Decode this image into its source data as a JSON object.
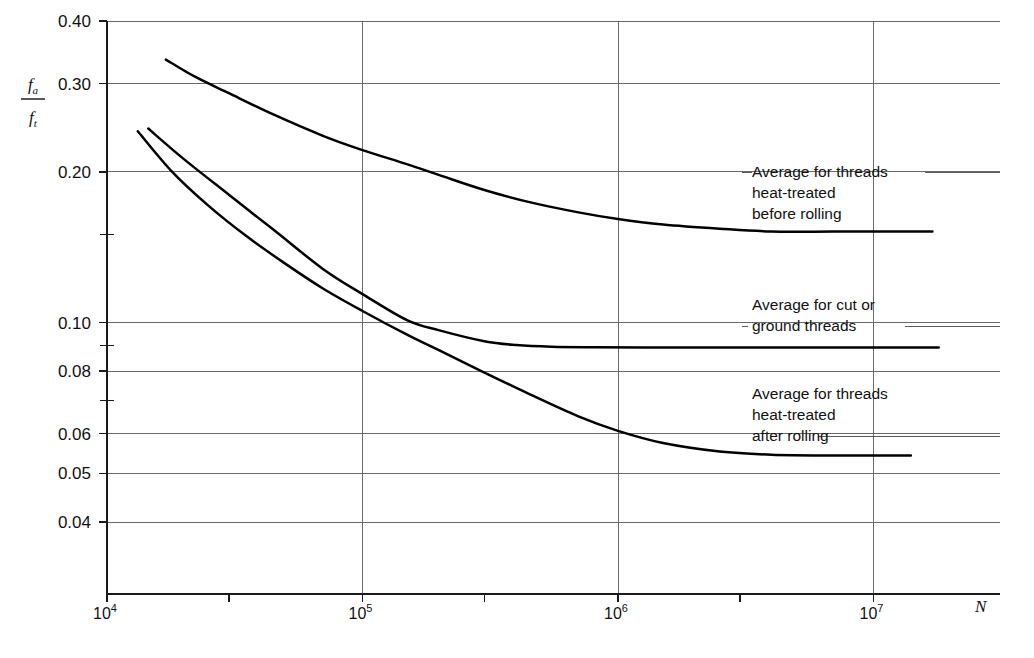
{
  "chart_data": {
    "type": "line",
    "title": "",
    "xlabel": "N",
    "ylabel": "fa/ft",
    "ylabel_numerator": "f",
    "ylabel_numerator_sub": "a",
    "ylabel_denominator": "f",
    "ylabel_denominator_sub": "t",
    "x_scale": "log",
    "y_scale": "log",
    "xlim": [
      10000,
      20000000
    ],
    "ylim": [
      0.032,
      0.44
    ],
    "grid": true,
    "legend_position": "inline-annotations",
    "x_ticks": [
      {
        "value": 10000,
        "label": "10",
        "exponent": "4",
        "major": true
      },
      {
        "value": 30000,
        "label": "",
        "exponent": "",
        "major": false
      },
      {
        "value": 100000,
        "label": "10",
        "exponent": "5",
        "major": true
      },
      {
        "value": 300000,
        "label": "",
        "exponent": "",
        "major": false
      },
      {
        "value": 1000000,
        "label": "10",
        "exponent": "6",
        "major": true
      },
      {
        "value": 3000000,
        "label": "",
        "exponent": "",
        "major": false
      },
      {
        "value": 10000000,
        "label": "10",
        "exponent": "7",
        "major": true
      }
    ],
    "y_ticks": [
      {
        "value": 0.4,
        "label": "0.40",
        "major": true
      },
      {
        "value": 0.3,
        "label": "0.30",
        "major": true
      },
      {
        "value": 0.2,
        "label": "0.20",
        "major": true
      },
      {
        "value": 0.15,
        "label": "",
        "major": false
      },
      {
        "value": 0.1,
        "label": "0.10",
        "major": true
      },
      {
        "value": 0.09,
        "label": "",
        "major": false
      },
      {
        "value": 0.08,
        "label": "0.08",
        "major": true
      },
      {
        "value": 0.07,
        "label": "",
        "major": false
      },
      {
        "value": 0.06,
        "label": "0.06",
        "major": true
      },
      {
        "value": 0.05,
        "label": "0.05",
        "major": true
      },
      {
        "value": 0.04,
        "label": "0.04",
        "major": true
      }
    ],
    "series": [
      {
        "name": "Average for threads heat-treated before rolling",
        "label_lines": [
          "Average for threads",
          "heat-treated",
          "before rolling"
        ],
        "points": [
          [
            17000,
            0.335
          ],
          [
            22000,
            0.31
          ],
          [
            30000,
            0.287
          ],
          [
            45000,
            0.26
          ],
          [
            70000,
            0.236
          ],
          [
            100000,
            0.221
          ],
          [
            150000,
            0.207
          ],
          [
            200000,
            0.197
          ],
          [
            300000,
            0.184
          ],
          [
            450000,
            0.174
          ],
          [
            700000,
            0.166
          ],
          [
            1000000,
            0.161
          ],
          [
            1500000,
            0.157
          ],
          [
            2500000,
            0.154
          ],
          [
            4000000,
            0.152
          ],
          [
            7000000,
            0.152
          ],
          [
            12000000,
            0.152
          ],
          [
            17000000,
            0.152
          ]
        ]
      },
      {
        "name": "Average for cut or ground threads",
        "label_lines": [
          "Average for cut or",
          "ground threads"
        ],
        "points": [
          [
            14500,
            0.244
          ],
          [
            20000,
            0.212
          ],
          [
            30000,
            0.18
          ],
          [
            45000,
            0.153
          ],
          [
            70000,
            0.128
          ],
          [
            100000,
            0.114
          ],
          [
            150000,
            0.101
          ],
          [
            200000,
            0.0965
          ],
          [
            300000,
            0.0918
          ],
          [
            400000,
            0.0902
          ],
          [
            550000,
            0.0895
          ],
          [
            800000,
            0.0893
          ],
          [
            1500000,
            0.0892
          ],
          [
            3000000,
            0.0892
          ],
          [
            7000000,
            0.0892
          ],
          [
            12000000,
            0.0892
          ],
          [
            18000000,
            0.0892
          ]
        ]
      },
      {
        "name": "Average for threads heat-treated after rolling",
        "label_lines": [
          "Average for threads",
          "heat-treated",
          "after rolling"
        ],
        "points": [
          [
            13200,
            0.241
          ],
          [
            18000,
            0.2
          ],
          [
            25000,
            0.171
          ],
          [
            35000,
            0.149
          ],
          [
            50000,
            0.131
          ],
          [
            70000,
            0.117
          ],
          [
            100000,
            0.1055
          ],
          [
            150000,
            0.0945
          ],
          [
            200000,
            0.088
          ],
          [
            300000,
            0.0795
          ],
          [
            450000,
            0.072
          ],
          [
            700000,
            0.065
          ],
          [
            1000000,
            0.0608
          ],
          [
            1500000,
            0.0575
          ],
          [
            2500000,
            0.0553
          ],
          [
            4000000,
            0.0545
          ],
          [
            7000000,
            0.0543
          ],
          [
            11000000,
            0.0543
          ],
          [
            14000000,
            0.0543
          ]
        ]
      }
    ],
    "annotations": [
      {
        "id": "annot-before-rolling",
        "lines": [
          "Average for threads",
          "heat-treated",
          "before rolling"
        ],
        "x": 752,
        "y": 177
      },
      {
        "id": "annot-cut-ground",
        "lines": [
          "Average for cut or",
          "ground threads"
        ],
        "x": 752,
        "y": 310
      },
      {
        "id": "annot-after-rolling",
        "lines": [
          "Average for threads",
          "heat-treated",
          "after rolling"
        ],
        "x": 752,
        "y": 399
      }
    ]
  },
  "axis_label_x": "N"
}
